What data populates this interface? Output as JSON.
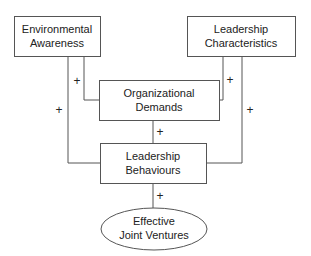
{
  "diagram": {
    "nodes": [
      {
        "id": "environmental-awareness",
        "line1": "Environmental",
        "line2": "Awareness",
        "shape": "rect"
      },
      {
        "id": "leadership-characteristics",
        "line1": "Leadership",
        "line2": "Characteristics",
        "shape": "rect"
      },
      {
        "id": "organizational-demands",
        "line1": "Organizational",
        "line2": "Demands",
        "shape": "rect"
      },
      {
        "id": "leadership-behaviours",
        "line1": "Leadership",
        "line2": "Behaviours",
        "shape": "rect"
      },
      {
        "id": "effective-joint-ventures",
        "line1": "Effective",
        "line2": "Joint Ventures",
        "shape": "ellipse"
      }
    ],
    "edges": [
      {
        "from": "environmental-awareness",
        "to": "organizational-demands",
        "sign": "+"
      },
      {
        "from": "environmental-awareness",
        "to": "leadership-behaviours",
        "sign": "+"
      },
      {
        "from": "leadership-characteristics",
        "to": "organizational-demands",
        "sign": "+"
      },
      {
        "from": "leadership-characteristics",
        "to": "leadership-behaviours",
        "sign": "+"
      },
      {
        "from": "organizational-demands",
        "to": "leadership-behaviours",
        "sign": "+"
      },
      {
        "from": "leadership-behaviours",
        "to": "effective-joint-ventures",
        "sign": "+"
      }
    ]
  }
}
